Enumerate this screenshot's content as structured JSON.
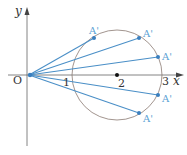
{
  "diagram": {
    "axes": {
      "x_label": "x",
      "y_label": "y",
      "origin_label": "O",
      "ticks": [
        "1",
        "2",
        "3"
      ]
    },
    "circle": {
      "center_label": "2",
      "center": [
        2,
        0
      ],
      "radius": 1
    },
    "points": [
      {
        "label": "A'"
      },
      {
        "label": "A'"
      },
      {
        "label": "A'"
      },
      {
        "label": "A'"
      },
      {
        "label": "A'"
      }
    ],
    "colors": {
      "segment": "#4a8fc7",
      "point_label": "#5a9fd4",
      "circle": "#8a7a72",
      "axis": "#555555"
    }
  }
}
